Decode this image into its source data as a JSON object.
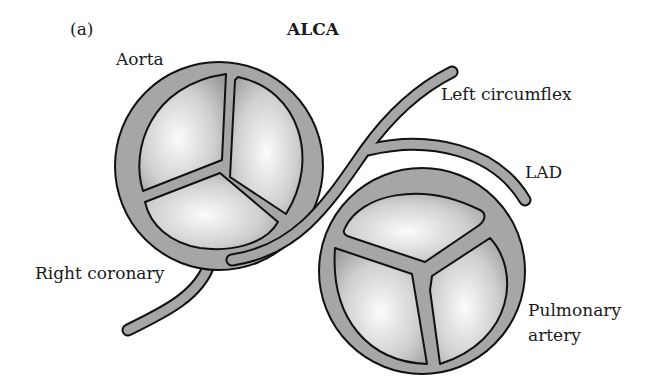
{
  "figure": {
    "panel_label": "(a)",
    "title": "ALCA"
  },
  "labels": {
    "aorta": "Aorta",
    "left_circumflex": "Left circumflex",
    "lad": "LAD",
    "right_coronary": "Right coronary",
    "pulmonary_line1": "Pulmonary",
    "pulmonary_line2": "artery"
  },
  "colors": {
    "wall": "#a6a6a6",
    "outline": "#111111",
    "cusp_light": "#f4f4f4",
    "cusp_dark": "#9a9a9a",
    "background": "#ffffff"
  }
}
